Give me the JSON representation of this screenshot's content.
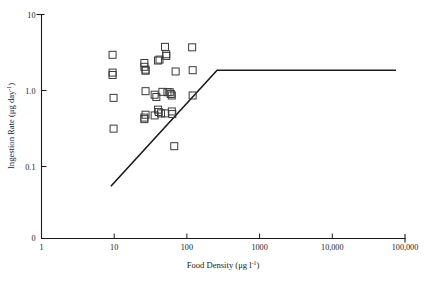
{
  "figure": {
    "background": "#ffffff",
    "ink_color": "#1a1a1a",
    "marker_color": "#3a3a3a"
  },
  "chart_data": {
    "type": "scatter",
    "title": "",
    "xlabel": "Food Density (μg l⁻¹)",
    "ylabel": "Ingestion Rate (μg day⁻¹)",
    "xscale": "log",
    "yscale": "log",
    "xlim": [
      1,
      100000
    ],
    "ylim": [
      0.03,
      10
    ],
    "grid": false,
    "legend": null,
    "xticks": [
      1,
      10,
      100,
      1000,
      10000,
      100000
    ],
    "xticklabels": [
      "1",
      "10",
      "100",
      "1000",
      "10,000",
      "100,000"
    ],
    "yticks": [
      0.1,
      1.0,
      10
    ],
    "yticklabels": [
      "0.1",
      "1.0",
      "10"
    ],
    "y_origin_label": "0",
    "marker_style": "open-square",
    "n_points": 32,
    "points": [
      [
        9.5,
        2.95
      ],
      [
        9.5,
        1.72
      ],
      [
        9.5,
        1.6
      ],
      [
        9.8,
        0.8
      ],
      [
        9.8,
        0.315
      ],
      [
        26,
        2.3
      ],
      [
        26,
        2.05
      ],
      [
        27,
        1.88
      ],
      [
        27,
        1.82
      ],
      [
        42,
        2.55
      ],
      [
        40,
        2.48
      ],
      [
        50,
        3.75
      ],
      [
        52,
        3.0
      ],
      [
        52,
        2.85
      ],
      [
        70,
        1.78
      ],
      [
        118,
        3.7
      ],
      [
        120,
        1.85
      ],
      [
        27,
        0.98
      ],
      [
        46,
        0.96
      ],
      [
        36,
        0.88
      ],
      [
        38,
        0.82
      ],
      [
        54,
        0.95
      ],
      [
        58,
        0.95
      ],
      [
        60,
        0.9
      ],
      [
        62,
        0.86
      ],
      [
        120,
        0.86
      ],
      [
        27,
        0.48
      ],
      [
        26,
        0.44
      ],
      [
        26,
        0.42
      ],
      [
        40,
        0.56
      ],
      [
        41,
        0.52
      ],
      [
        44,
        0.5
      ],
      [
        36,
        0.47
      ],
      [
        50,
        0.5
      ],
      [
        62,
        0.53
      ],
      [
        63,
        0.49
      ],
      [
        67,
        0.185
      ]
    ],
    "fit_line": {
      "description": "two-phase linear-plateau model fit",
      "segments": [
        {
          "from": [
            9.0,
            0.055
          ],
          "to": [
            260,
            1.85
          ]
        },
        {
          "from": [
            260,
            1.85
          ],
          "to": [
            75000,
            1.85
          ]
        }
      ],
      "plateau_value": 1.85,
      "breakpoint_x": 260
    }
  }
}
